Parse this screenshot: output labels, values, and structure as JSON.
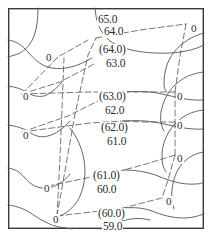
{
  "figure": {
    "frame": {
      "x": 8,
      "y": 8,
      "width": 196,
      "height": 221,
      "color": "#3a3a3a",
      "line_width": 1.4
    },
    "canvas": {
      "width": 214,
      "height": 241,
      "background": "#ffffff"
    },
    "styles": {
      "contour_color": "#555555",
      "contour_width": 0.9,
      "dashed_color": "#666666",
      "dashed_width": 0.9,
      "dash_pattern": "6,3",
      "label_color": "#2b2b2b"
    }
  },
  "chart_data": {
    "type": "contour",
    "xlabel": "",
    "ylabel": "",
    "grid": false,
    "legend": "none",
    "units": "elevation",
    "contour_interval": 1.0,
    "level_min": 59.0,
    "level_max": 65.0,
    "levels": [
      59.0,
      60.0,
      61.0,
      62.0,
      63.0,
      64.0,
      65.0
    ],
    "contour_labels": [
      {
        "text": "65.0",
        "x": 97,
        "y": 14,
        "level": 65.0,
        "parenthesized": false
      },
      {
        "text": "64.0",
        "x": 103,
        "y": 26,
        "level": 64.0,
        "parenthesized": false
      },
      {
        "text": "(64.0)",
        "x": 98,
        "y": 44,
        "level": 64.0,
        "parenthesized": true
      },
      {
        "text": "63.0",
        "x": 105,
        "y": 58,
        "level": 63.0,
        "parenthesized": false
      },
      {
        "text": "(63.0)",
        "x": 98,
        "y": 91,
        "level": 63.0,
        "parenthesized": true
      },
      {
        "text": "62.0",
        "x": 104,
        "y": 105,
        "level": 62.0,
        "parenthesized": false
      },
      {
        "text": "(62.0)",
        "x": 100,
        "y": 122,
        "level": 62.0,
        "parenthesized": true
      },
      {
        "text": "61.0",
        "x": 106,
        "y": 136,
        "level": 61.0,
        "parenthesized": false
      },
      {
        "text": "(61.0)",
        "x": 92,
        "y": 170,
        "level": 61.0,
        "parenthesized": true
      },
      {
        "text": "60.0",
        "x": 96,
        "y": 184,
        "level": 60.0,
        "parenthesized": false
      },
      {
        "text": "(60.0)",
        "x": 97,
        "y": 208,
        "level": 60.0,
        "parenthesized": true
      },
      {
        "text": "59.0",
        "x": 102,
        "y": 221,
        "level": 59.0,
        "parenthesized": false
      }
    ],
    "node_labels": [
      {
        "text": "0",
        "x": 45,
        "y": 52,
        "side": "left"
      },
      {
        "text": "0",
        "x": 22,
        "y": 91,
        "side": "left"
      },
      {
        "text": "0",
        "x": 22,
        "y": 130,
        "side": "left"
      },
      {
        "text": "0",
        "x": 43,
        "y": 183,
        "side": "left"
      },
      {
        "text": "0",
        "x": 52,
        "y": 214,
        "side": "left"
      },
      {
        "text": "0",
        "x": 190,
        "y": 23,
        "side": "right"
      },
      {
        "text": "0",
        "x": 176,
        "y": 91,
        "side": "right"
      },
      {
        "text": "0",
        "x": 176,
        "y": 120,
        "side": "right"
      },
      {
        "text": "0",
        "x": 176,
        "y": 153,
        "side": "right"
      },
      {
        "text": "0",
        "x": 165,
        "y": 196,
        "side": "right"
      }
    ],
    "contour_paths": [
      {
        "level": 65.0,
        "d": "M 38,8 C 38,18 37,28 34,36 C 31,44 26,50 18,54 L 8,57"
      },
      {
        "level": 65.0,
        "d": "M 95,8 C 96,22 100,33 110,41 C 122,50 145,54 170,53 C 186,52 196,49 204,45"
      },
      {
        "level": 64.5,
        "d": "M 8,40 C 16,41 22,45 28,52 C 35,60 41,66 52,68 C 63,70 77,67 92,58"
      },
      {
        "level": 64.0,
        "d": "M 204,33 C 193,36 182,42 174,52 C 167,61 164,72 164,84 C 164,88 165,90 167,92"
      },
      {
        "level": 63.5,
        "d": "M 8,86 C 16,87 22,89 28,93 C 33,96 38,97 44,96 C 50,94 56,89 62,82"
      },
      {
        "level": 63.0,
        "d": "M 122,92 C 136,91 150,91 162,94 C 176,97 188,101 204,100"
      },
      {
        "level": 63.0,
        "d": "M 204,72 C 192,73 182,78 174,86 C 167,93 163,102 161,112 C 160,120 161,126 164,131"
      },
      {
        "level": 62.5,
        "d": "M 8,125 C 16,126 23,128 29,132 C 35,136 41,138 48,136 C 56,134 63,129 70,121"
      },
      {
        "level": 62.0,
        "d": "M 124,121 C 138,120 152,121 164,124 C 178,127 190,130 204,129"
      },
      {
        "level": 62.0,
        "d": "M 204,110 C 192,111 182,116 174,125 C 166,134 162,145 162,156 C 162,163 163,168 166,172"
      },
      {
        "level": 61.5,
        "d": "M 8,168 C 15,169 20,172 25,178 C 31,185 38,189 47,188 C 56,187 64,182 70,174"
      },
      {
        "level": 61.0,
        "d": "M 124,170 C 136,170 148,172 158,176 C 170,181 182,185 196,184 C 200,184 202,183 204,182"
      },
      {
        "level": 60.5,
        "d": "M 70,128 C 77,137 82,148 84,160 C 86,172 85,184 80,196 C 76,205 69,212 60,216"
      },
      {
        "level": 60.0,
        "d": "M 124,208 C 134,207 144,208 152,211 C 162,215 172,218 184,218 C 192,218 198,216 204,214"
      },
      {
        "level": 60.0,
        "d": "M 204,152 C 196,153 188,157 182,164 C 176,171 173,180 172,190 C 171,198 172,204 174,209"
      },
      {
        "level": 59.0,
        "d": "M 8,205 C 18,206 27,210 35,216 C 44,222 54,227 66,228 L 72,229"
      },
      {
        "level": 59.0,
        "d": "M 100,229 C 108,226 116,222 126,220 C 134,218 142,218 150,220"
      }
    ],
    "dashed_paths": [
      {
        "d": "M 57,216 L 75,114 L 88,55 L 96,38"
      },
      {
        "d": "M 22,94 L 58,57 L 88,40"
      },
      {
        "d": "M 22,94 L 60,82 L 96,63"
      },
      {
        "d": "M 22,94 L 88,92 L 122,92"
      },
      {
        "d": "M 22,132 L 68,116 L 98,101"
      },
      {
        "d": "M 22,132 L 90,123 L 124,121"
      },
      {
        "d": "M 57,216 L 60,158 L 62,108 L 64,58"
      },
      {
        "d": "M 48,186 L 96,176 L 124,170"
      },
      {
        "d": "M 57,216 L 100,211 L 124,208"
      },
      {
        "d": "M 96,38 L 140,30 L 186,24"
      },
      {
        "d": "M 186,24 L 180,56 L 175,92"
      },
      {
        "d": "M 175,92 L 140,92 L 122,92"
      },
      {
        "d": "M 175,92 L 175,122"
      },
      {
        "d": "M 175,122 L 144,122 L 124,121"
      },
      {
        "d": "M 175,122 L 175,155"
      },
      {
        "d": "M 175,155 L 146,164 L 124,170"
      },
      {
        "d": "M 175,155 L 168,180 L 162,198"
      },
      {
        "d": "M 162,198 L 142,203 L 124,208"
      }
    ]
  }
}
